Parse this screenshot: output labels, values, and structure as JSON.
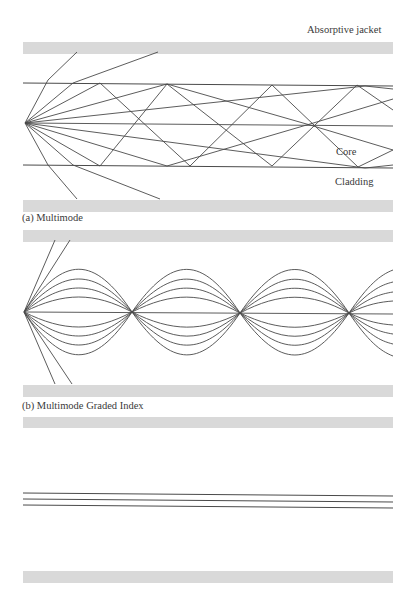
{
  "figure": {
    "panels": [
      {
        "caption": "(a)  Multimode",
        "labels": {
          "jacket": "Absorptive jacket",
          "core": "Core",
          "cladding": "Cladding"
        }
      },
      {
        "caption": "(b)  Multimode Graded Index"
      },
      {
        "caption": ""
      }
    ],
    "colors": {
      "jacket": "#d9d9d9",
      "line": "#4a4a4a",
      "background": "#ffffff"
    }
  }
}
